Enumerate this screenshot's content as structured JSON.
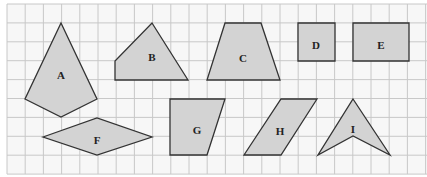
{
  "diagram": {
    "title": "",
    "grid": {
      "origin_x": 7,
      "origin_y": 4,
      "cell_w": 18.2,
      "cell_h": 18.9,
      "cols": 23,
      "rows": 9,
      "line_color": "#c8c8c8",
      "background": "#f7f7f7"
    },
    "style": {
      "fill": "#d3d3d3",
      "stroke": "#333333"
    },
    "shapes": [
      {
        "label": "A",
        "type": "kite",
        "points": [
          [
            61,
            23
          ],
          [
            97,
            99
          ],
          [
            61,
            117
          ],
          [
            25,
            99
          ]
        ],
        "label_pos": [
          61,
          76
        ]
      },
      {
        "label": "B",
        "type": "quadrilateral",
        "points": [
          [
            152,
            23
          ],
          [
            188,
            80
          ],
          [
            115,
            80
          ],
          [
            115,
            61
          ]
        ],
        "label_pos": [
          152,
          58
        ]
      },
      {
        "label": "C",
        "type": "trapezium",
        "points": [
          [
            225,
            23
          ],
          [
            261,
            23
          ],
          [
            280,
            80
          ],
          [
            207,
            80
          ]
        ],
        "label_pos": [
          243,
          59
        ]
      },
      {
        "label": "D",
        "type": "square",
        "points": [
          [
            298,
            23
          ],
          [
            335,
            23
          ],
          [
            335,
            61
          ],
          [
            298,
            61
          ]
        ],
        "label_pos": [
          316,
          46
        ]
      },
      {
        "label": "E",
        "type": "rectangle",
        "points": [
          [
            353,
            23
          ],
          [
            409,
            23
          ],
          [
            409,
            61
          ],
          [
            353,
            61
          ]
        ],
        "label_pos": [
          381,
          46
        ]
      },
      {
        "label": "F",
        "type": "rhombus",
        "points": [
          [
            43,
            137
          ],
          [
            97,
            118
          ],
          [
            152,
            137
          ],
          [
            97,
            155
          ]
        ],
        "label_pos": [
          97,
          141
        ]
      },
      {
        "label": "G",
        "type": "right-trapezium",
        "points": [
          [
            170,
            99
          ],
          [
            225,
            99
          ],
          [
            207,
            155
          ],
          [
            170,
            155
          ]
        ],
        "label_pos": [
          197,
          131
        ]
      },
      {
        "label": "H",
        "type": "parallelogram",
        "points": [
          [
            281,
            99
          ],
          [
            317,
            99
          ],
          [
            281,
            155
          ],
          [
            244,
            155
          ]
        ],
        "label_pos": [
          280,
          132
        ]
      },
      {
        "label": "I",
        "type": "arrowhead",
        "points": [
          [
            353,
            99
          ],
          [
            390,
            155
          ],
          [
            353,
            136
          ],
          [
            318,
            155
          ]
        ],
        "label_pos": [
          353,
          130
        ]
      }
    ]
  }
}
